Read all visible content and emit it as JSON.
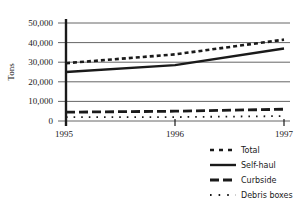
{
  "chart_data": {
    "type": "line",
    "title": "",
    "xlabel": "",
    "ylabel": "Tons",
    "x": [
      "1995",
      "1996",
      "1997"
    ],
    "ylim": [
      0,
      50000
    ],
    "yticks": [
      "0",
      "10,000",
      "20,000",
      "30,000",
      "40,000",
      "50,000"
    ],
    "grid": true,
    "legend_position": "bottom-right",
    "series": [
      {
        "name": "Total",
        "style": "dashed-short",
        "values": [
          29500,
          34000,
          41500
        ]
      },
      {
        "name": "Self-haul",
        "style": "solid",
        "values": [
          25000,
          28500,
          37000
        ]
      },
      {
        "name": "Curbside",
        "style": "dashed-long",
        "values": [
          4500,
          5000,
          6000
        ]
      },
      {
        "name": "Debris boxes",
        "style": "dotted",
        "values": [
          2000,
          2000,
          2500
        ]
      }
    ]
  },
  "legend": {
    "items": [
      {
        "label": "Total"
      },
      {
        "label": "Self-haul"
      },
      {
        "label": "Curbside"
      },
      {
        "label": "Debris boxes"
      }
    ]
  },
  "colors": {
    "line": "#1a1a1a",
    "grid": "#555555"
  }
}
